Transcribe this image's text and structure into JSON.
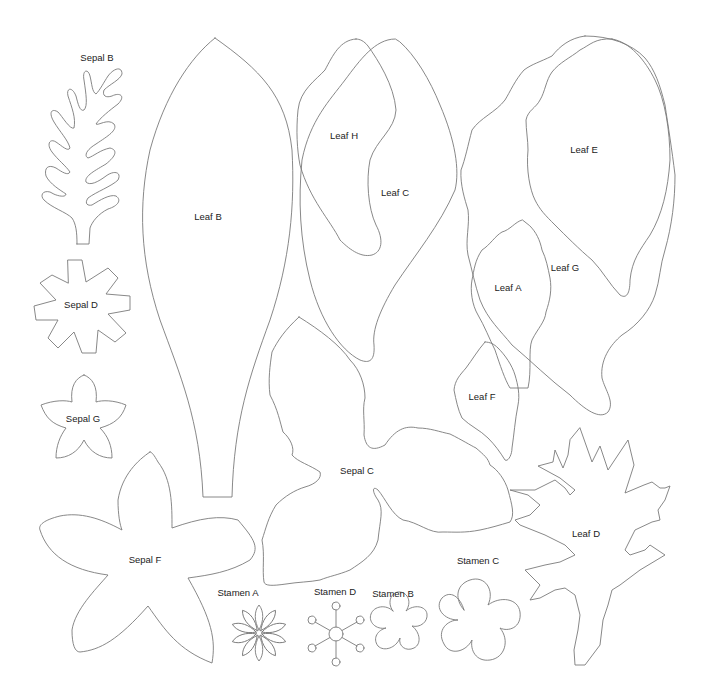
{
  "diagram": {
    "type": "paper flower cut-out template",
    "stroke_color": "#7a7a7a",
    "label_color": "#222222",
    "background": "#ffffff",
    "pieces": [
      {
        "id": "sepal_b",
        "label": "Sepal B",
        "x": 97,
        "y": 57
      },
      {
        "id": "leaf_b",
        "label": "Leaf B",
        "x": 208,
        "y": 216
      },
      {
        "id": "leaf_h",
        "label": "Leaf H",
        "x": 344,
        "y": 135
      },
      {
        "id": "leaf_c",
        "label": "Leaf C",
        "x": 395,
        "y": 192
      },
      {
        "id": "leaf_e",
        "label": "Leaf E",
        "x": 584,
        "y": 149
      },
      {
        "id": "leaf_g",
        "label": "Leaf G",
        "x": 565,
        "y": 267
      },
      {
        "id": "leaf_a",
        "label": "Leaf A",
        "x": 508,
        "y": 287
      },
      {
        "id": "sepal_d",
        "label": "Sepal D",
        "x": 81,
        "y": 304
      },
      {
        "id": "sepal_g",
        "label": "Sepal G",
        "x": 83,
        "y": 418
      },
      {
        "id": "leaf_f",
        "label": "Leaf F",
        "x": 482,
        "y": 396
      },
      {
        "id": "sepal_c",
        "label": "Sepal C",
        "x": 357,
        "y": 470
      },
      {
        "id": "leaf_d",
        "label": "Leaf D",
        "x": 586,
        "y": 533
      },
      {
        "id": "sepal_f",
        "label": "Sepal F",
        "x": 145,
        "y": 559
      },
      {
        "id": "stamen_c",
        "label": "Stamen C",
        "x": 478,
        "y": 560
      },
      {
        "id": "stamen_a",
        "label": "Stamen A",
        "x": 238,
        "y": 592
      },
      {
        "id": "stamen_d",
        "label": "Stamen D",
        "x": 335,
        "y": 591
      },
      {
        "id": "stamen_b",
        "label": "Stamen B",
        "x": 393,
        "y": 593
      }
    ]
  }
}
